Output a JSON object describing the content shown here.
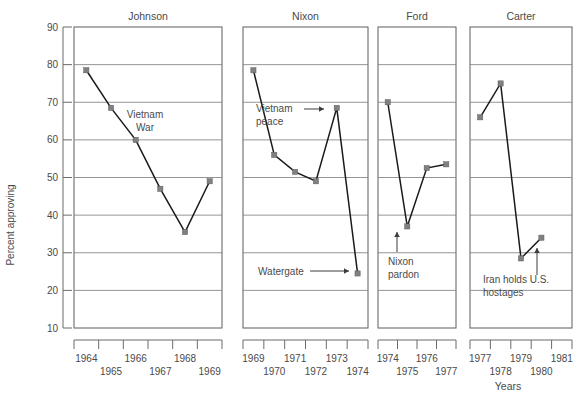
{
  "chart_data": {
    "type": "line",
    "title": "",
    "subtitle": "",
    "xlabel": "Years",
    "ylabel": "Percent approving",
    "ylim": [
      10,
      90
    ],
    "ytick_step": 10,
    "yticks": [
      90,
      80,
      70,
      60,
      50,
      40,
      30,
      20,
      10
    ],
    "grid": true,
    "legend": "none",
    "panels": [
      {
        "name": "Johnson",
        "xlim": [
          1964,
          1969
        ],
        "xticks": [
          1964,
          1965,
          1966,
          1967,
          1968,
          1969
        ],
        "x": [
          1964,
          1965,
          1966,
          1967,
          1968,
          1969
        ],
        "values": [
          78.5,
          68.5,
          60,
          47,
          35.5,
          49
        ],
        "annotations": [
          {
            "text_line1": "Vietnam",
            "text_line2": "War",
            "arrow": false
          }
        ]
      },
      {
        "name": "Nixon",
        "xlim": [
          1969,
          1974
        ],
        "xticks": [
          1969,
          1970,
          1971,
          1972,
          1973,
          1974
        ],
        "x": [
          1969,
          1970,
          1971,
          1972,
          1973,
          1974
        ],
        "values": [
          78.5,
          56,
          51.5,
          49,
          68.5,
          24.5
        ],
        "annotations": [
          {
            "text_line1": "Vietnam",
            "text_line2": "peace",
            "arrow": true
          },
          {
            "text_line1": "Watergate",
            "text_line2": "",
            "arrow": true
          }
        ]
      },
      {
        "name": "Ford",
        "xlim": [
          1974,
          1977
        ],
        "xticks": [
          1974,
          1975,
          1976,
          1977
        ],
        "x": [
          1974,
          1975,
          1976,
          1977
        ],
        "values": [
          70,
          37,
          52.5,
          53.5
        ],
        "annotations": [
          {
            "text_line1": "Nixon",
            "text_line2": "pardon",
            "arrow": true
          }
        ]
      },
      {
        "name": "Carter",
        "xlim": [
          1977,
          1981
        ],
        "xticks": [
          1977,
          1978,
          1979,
          1980,
          1981
        ],
        "x": [
          1977,
          1978,
          1979,
          1980,
          1981
        ],
        "values": [
          66,
          75,
          28.5,
          34
        ],
        "annotations": [
          {
            "text_line1": "Iran holds U.S.",
            "text_line2": "hostages",
            "arrow": true
          }
        ]
      }
    ]
  },
  "axis": {
    "ylabel": "Percent approving",
    "xlabel": "Years",
    "yticks": [
      "90",
      "80",
      "70",
      "60",
      "50",
      "40",
      "30",
      "20",
      "10"
    ]
  },
  "panels": {
    "johnson": {
      "title": "Johnson",
      "xticks": [
        "1964",
        "1965",
        "1966",
        "1967",
        "1968",
        "1969"
      ],
      "annotation_1_line1": "Vietnam",
      "annotation_1_line2": "War"
    },
    "nixon": {
      "title": "Nixon",
      "xticks": [
        "1969",
        "1970",
        "1971",
        "1972",
        "1973",
        "1974"
      ],
      "annotation_1_line1": "Vietnam",
      "annotation_1_line2": "peace",
      "annotation_2_line1": "Watergate"
    },
    "ford": {
      "title": "Ford",
      "xticks": [
        "1974",
        "1975",
        "1976",
        "1977"
      ],
      "annotation_1_line1": "Nixon",
      "annotation_1_line2": "pardon"
    },
    "carter": {
      "title": "Carter",
      "xticks": [
        "1977",
        "1978",
        "1979",
        "1980",
        "1981"
      ],
      "annotation_1_line1": "Iran holds U.S.",
      "annotation_1_line2": "hostages"
    }
  },
  "colors": {
    "line": "#1a1a1a",
    "marker": "#808080",
    "grid": "#7a7a7a",
    "text": "#4a4a4a",
    "background": "#ffffff"
  }
}
